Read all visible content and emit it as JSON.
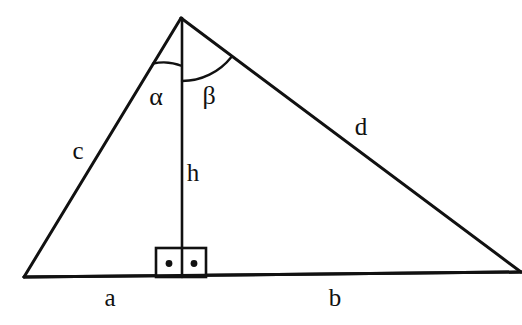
{
  "figure": {
    "type": "geometry-diagram",
    "background_color": "#ffffff",
    "stroke_color": "#111111",
    "canvas": {
      "width": 522,
      "height": 325
    }
  },
  "vertices": {
    "apex": {
      "name": "apex",
      "x": 181,
      "y": 18
    },
    "bottom_left": {
      "name": "bottom-left-vertex",
      "x": 24,
      "y": 277
    },
    "bottom_right": {
      "name": "bottom-right-vertex",
      "x": 521,
      "y": 272
    },
    "foot": {
      "name": "altitude-foot",
      "x": 182,
      "y": 277
    }
  },
  "segments": [
    {
      "id": "side-c",
      "label": "c",
      "from": "apex",
      "to": "bottom_left"
    },
    {
      "id": "side-d",
      "label": "d",
      "from": "apex",
      "to": "bottom_right"
    },
    {
      "id": "segment-a",
      "label": "a",
      "from": "bottom_left",
      "to": "foot"
    },
    {
      "id": "segment-b",
      "label": "b",
      "from": "foot",
      "to": "bottom_right"
    },
    {
      "id": "altitude-h",
      "label": "h",
      "from": "apex",
      "to": "foot"
    }
  ],
  "labels": {
    "side_c": {
      "text": "c",
      "x": 78,
      "y": 150
    },
    "side_d": {
      "text": "d",
      "x": 361,
      "y": 126
    },
    "segment_a": {
      "text": "a",
      "x": 110,
      "y": 297
    },
    "segment_b": {
      "text": "b",
      "x": 335,
      "y": 297
    },
    "altitude_h": {
      "text": "h",
      "x": 193,
      "y": 172
    },
    "angle_alpha": {
      "text": "α",
      "x": 156,
      "y": 97
    },
    "angle_beta": {
      "text": "β",
      "x": 209,
      "y": 96
    }
  },
  "angles": [
    {
      "id": "angle-alpha",
      "symbol": "α",
      "between": [
        "side-c",
        "altitude-h"
      ],
      "vertex": "apex",
      "arc_radius": 48
    },
    {
      "id": "angle-beta",
      "symbol": "β",
      "between": [
        "altitude-h",
        "side-d"
      ],
      "vertex": "apex",
      "arc_radius": 63
    }
  ],
  "right_angle_marker": {
    "id": "right-angle-box",
    "x": 156,
    "y": 248,
    "width": 50,
    "height": 29,
    "dot_count": 2,
    "dots": [
      {
        "x": 169,
        "y": 264
      },
      {
        "x": 194,
        "y": 264
      }
    ]
  }
}
